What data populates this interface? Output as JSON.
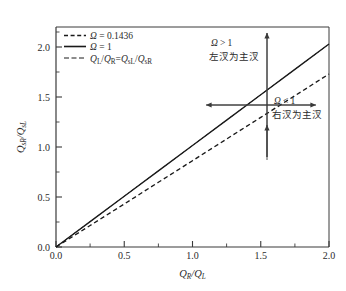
{
  "chart_data": {
    "type": "line",
    "title": "",
    "xlabel": "Q_R/Q_L",
    "ylabel": "Q_sR/Q_sL",
    "xlim": [
      0.0,
      2.0
    ],
    "ylim": [
      0.0,
      2.2
    ],
    "grid": false,
    "legend_position": "upper-left",
    "xticks": [
      "0.0",
      "0.5",
      "1.0",
      "1.5",
      "2.0"
    ],
    "xtick_values": [
      0.0,
      0.5,
      1.0,
      1.5,
      2.0
    ],
    "yticks": [
      "0.0",
      "0.5",
      "1.0",
      "1.5",
      "2.0"
    ],
    "ytick_values": [
      0.0,
      0.5,
      1.0,
      1.5,
      2.0
    ],
    "x": [
      0.0,
      0.25,
      0.5,
      0.75,
      1.0,
      1.25,
      1.5,
      1.75,
      2.0
    ],
    "series": [
      {
        "name": "Omega = 0.1436",
        "style": "dashed",
        "color": "#1a1a1a",
        "values": [
          0.0,
          0.215,
          0.43,
          0.647,
          0.863,
          1.08,
          1.296,
          1.513,
          1.73
        ]
      },
      {
        "name": "Omega = 1",
        "style": "solid",
        "color": "#1a1a1a",
        "values": [
          0.0,
          0.254,
          0.508,
          0.761,
          1.015,
          1.269,
          1.523,
          1.776,
          2.03
        ]
      },
      {
        "name": "QL/QR = QsL/QsR",
        "style": "dash-dot",
        "color": "#1a1a1a",
        "values": [
          0.0,
          0.254,
          0.508,
          0.761,
          1.015,
          1.269,
          1.523,
          1.776,
          2.03
        ]
      }
    ],
    "annotations": [
      {
        "id": "upper-region",
        "line1": "Ω > 1",
        "line2": "左汊为主汊",
        "at": [
          1.2,
          1.95
        ]
      },
      {
        "id": "lower-region",
        "line1": "Ω < 1",
        "line2": "右汊为主汊",
        "at": [
          1.62,
          1.25
        ]
      }
    ],
    "crosshair": {
      "x": 1.55,
      "y": 1.58,
      "vertical_span": [
        0.9,
        2.18
      ],
      "horizontal_span": [
        0.72,
        1.92
      ]
    }
  },
  "legend": {
    "items": [
      {
        "style": "dashed",
        "symbol": "Ω",
        "relation": " = ",
        "value": "0.1436",
        "full_label": "Ω = 0.1436"
      },
      {
        "style": "solid",
        "symbol": "Ω",
        "relation": " = ",
        "value": "1",
        "full_label": "Ω = 1"
      },
      {
        "style": "dash-dot",
        "symbol": "Q",
        "relation": "=",
        "value": "",
        "full_label": "Qₗ/Qᴿ = Qₛₗ/Qₛᴿ",
        "num1_base": "Q",
        "num1_sub": "L",
        "den1_base": "Q",
        "den1_sub": "R",
        "num2_base": "Q",
        "num2_sub": "sL",
        "den2_base": "Q",
        "den2_sub": "sR"
      }
    ]
  },
  "axes": {
    "x_title_base": "Q",
    "x_title_sub1": "R",
    "x_title_slash": "/",
    "x_title_base2": "Q",
    "x_title_sub2": "L",
    "y_title_base": "Q",
    "y_title_sub1": "sR",
    "y_title_slash": "/",
    "y_title_base2": "Q",
    "y_title_sub2": "sL"
  },
  "annotations": {
    "upper_symbol": "Ω",
    "upper_relation": "> 1",
    "upper_cn": "左汊为主汊",
    "lower_symbol": "Ω",
    "lower_relation": "< 1",
    "lower_cn": "右汊为主汊"
  },
  "colors": {
    "axis": "#3a3a3a",
    "line": "#1a1a1a",
    "text": "#2b2b2b",
    "background": "#ffffff"
  }
}
